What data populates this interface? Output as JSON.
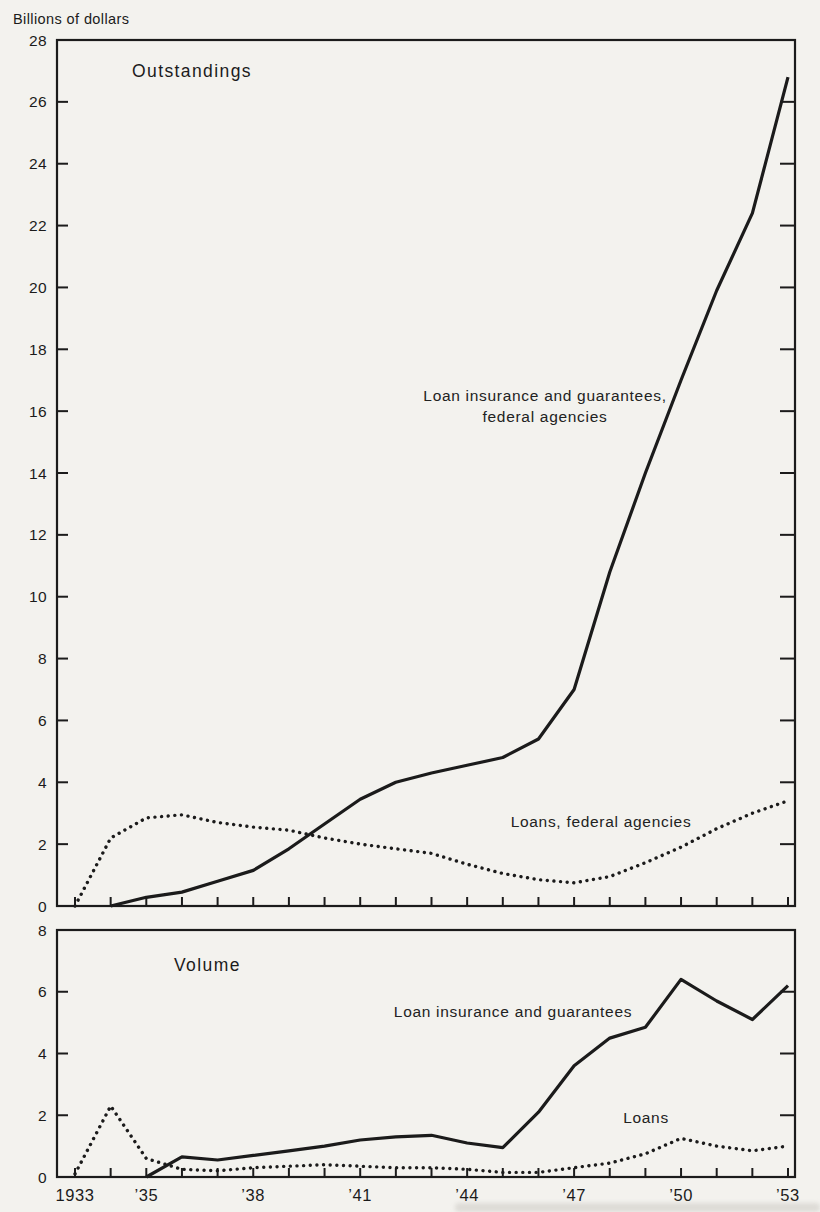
{
  "page": {
    "background_color": "#f3f2ee",
    "ink_color": "#1b1b1b"
  },
  "chart_data": [
    {
      "type": "line",
      "key": "outstandings",
      "title": "Outstandings",
      "ylabel": "Billions of dollars",
      "xlabel": "",
      "ylim": [
        0,
        28
      ],
      "ytick_step": 2,
      "grid": false,
      "legend_position": "inline-annotations",
      "x": [
        1933,
        1934,
        1935,
        1936,
        1937,
        1938,
        1939,
        1940,
        1941,
        1942,
        1943,
        1944,
        1945,
        1946,
        1947,
        1948,
        1949,
        1950,
        1951,
        1952,
        1953
      ],
      "series": [
        {
          "key": "loan_insurance_and_guarantees",
          "name": "Loan insurance and guarantees, federal agencies",
          "style": "solid",
          "values": [
            null,
            0,
            0.28,
            0.45,
            0.8,
            1.15,
            1.85,
            2.65,
            3.45,
            4.0,
            4.3,
            4.55,
            4.8,
            5.4,
            7.0,
            10.8,
            14.0,
            17.0,
            19.9,
            22.4,
            26.8
          ],
          "annotation": {
            "lines": [
              "Loan insurance and guarantees,",
              "federal agencies"
            ],
            "x": 545,
            "y": 401
          }
        },
        {
          "key": "loans",
          "name": "Loans, federal agencies",
          "style": "dotted",
          "values": [
            0,
            2.2,
            2.85,
            2.95,
            2.7,
            2.55,
            2.45,
            2.2,
            2.0,
            1.85,
            1.7,
            1.35,
            1.05,
            0.85,
            0.75,
            0.95,
            1.4,
            1.9,
            2.5,
            3.0,
            3.4
          ],
          "annotation": {
            "lines": [
              "Loans, federal agencies"
            ],
            "x": 601,
            "y": 827
          }
        }
      ]
    },
    {
      "type": "line",
      "key": "volume",
      "title": "Volume",
      "ylabel": "",
      "xlabel": "",
      "ylim": [
        0,
        8
      ],
      "ytick_step": 2,
      "grid": false,
      "legend_position": "inline-annotations",
      "x": [
        1933,
        1934,
        1935,
        1936,
        1937,
        1938,
        1939,
        1940,
        1941,
        1942,
        1943,
        1944,
        1945,
        1946,
        1947,
        1948,
        1949,
        1950,
        1951,
        1952,
        1953
      ],
      "xtick_label_years": [
        1933,
        1935,
        1938,
        1941,
        1944,
        1947,
        1950,
        1953
      ],
      "xtick_labels": [
        "1933",
        "’35",
        "’38",
        "’41",
        "’44",
        "’47",
        "’50",
        "’53"
      ],
      "show_x_tick_labels": true,
      "series": [
        {
          "key": "loan_insurance_and_guarantees",
          "name": "Loan insurance and guarantees",
          "style": "solid",
          "values": [
            null,
            null,
            0,
            0.65,
            0.55,
            0.7,
            0.85,
            1.0,
            1.2,
            1.3,
            1.35,
            1.1,
            0.95,
            2.1,
            3.6,
            4.5,
            4.85,
            6.4,
            5.7,
            5.1,
            6.2
          ],
          "annotation": {
            "lines": [
              "Loan insurance and guarantees"
            ],
            "x": 513,
            "y": 1017
          }
        },
        {
          "key": "loans",
          "name": "Loans",
          "style": "dotted",
          "values": [
            0.1,
            2.3,
            0.6,
            0.25,
            0.2,
            0.3,
            0.35,
            0.4,
            0.35,
            0.3,
            0.3,
            0.25,
            0.15,
            0.15,
            0.3,
            0.45,
            0.75,
            1.25,
            1.0,
            0.85,
            1.0
          ],
          "annotation": {
            "lines": [
              "Loans"
            ],
            "x": 646,
            "y": 1123
          }
        }
      ]
    }
  ]
}
